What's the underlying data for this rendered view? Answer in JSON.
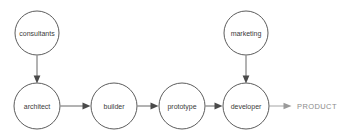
{
  "diagram": {
    "background_color": "#ffffff",
    "node_stroke_color": "#4a4a4a",
    "node_fill_color": "#ffffff",
    "edge_color": "#555555",
    "terminal_color": "#8c8c8c",
    "nodes": [
      {
        "id": "consultants",
        "label": "consultants",
        "shape": "circle",
        "cx": 37,
        "cy": 33,
        "r": 22,
        "row": "top"
      },
      {
        "id": "marketing",
        "label": "marketing",
        "shape": "circle",
        "cx": 246,
        "cy": 33,
        "r": 22,
        "row": "top"
      },
      {
        "id": "architect",
        "label": "architect",
        "shape": "circle",
        "cx": 37,
        "cy": 106,
        "r": 23,
        "row": "bottom"
      },
      {
        "id": "builder",
        "label": "builder",
        "shape": "circle",
        "cx": 114,
        "cy": 106,
        "r": 23,
        "row": "bottom"
      },
      {
        "id": "prototype",
        "label": "prototype",
        "shape": "circle",
        "cx": 182,
        "cy": 106,
        "r": 23,
        "row": "bottom"
      },
      {
        "id": "developer",
        "label": "developer",
        "shape": "circle",
        "cx": 246,
        "cy": 106,
        "r": 23,
        "row": "bottom"
      }
    ],
    "terminal": {
      "id": "product",
      "label": "PRODUCT",
      "x": 297,
      "y": 106
    },
    "edges": [
      {
        "id": "consultants-to-architect",
        "from": "consultants",
        "to": "architect",
        "direction": "down"
      },
      {
        "id": "marketing-to-developer",
        "from": "marketing",
        "to": "developer",
        "direction": "down"
      },
      {
        "id": "architect-to-builder",
        "from": "architect",
        "to": "builder",
        "direction": "right"
      },
      {
        "id": "builder-to-prototype",
        "from": "builder",
        "to": "prototype",
        "direction": "right"
      },
      {
        "id": "prototype-to-developer",
        "from": "prototype",
        "to": "developer",
        "direction": "right"
      },
      {
        "id": "developer-to-product",
        "from": "developer",
        "to": "product",
        "direction": "right"
      }
    ]
  }
}
